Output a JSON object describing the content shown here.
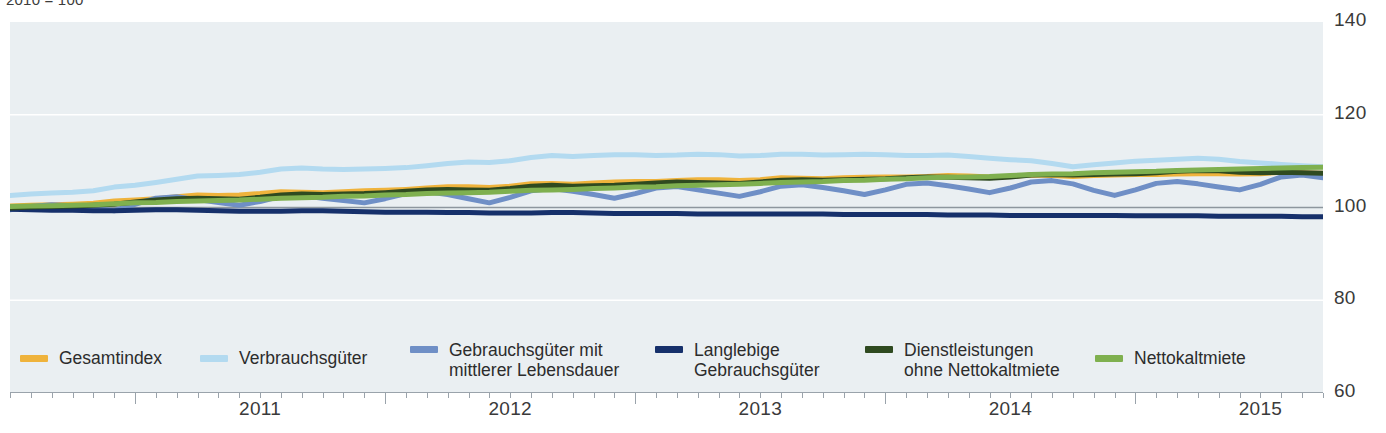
{
  "caption": "2010 = 100",
  "axes": {
    "y_ticks": [
      "140",
      "120",
      "100",
      "80",
      "60"
    ],
    "x_ticks": [
      "2011",
      "2012",
      "2013",
      "2014",
      "2015"
    ]
  },
  "legend": [
    {
      "label": "Gesamtindex",
      "color": "#efb33c"
    },
    {
      "label": "Verbrauchsgüter",
      "color": "#b3daf0"
    },
    {
      "label": "Gebrauchsgüter mit\nmittlerer Lebensdauer",
      "color": "#6f8fc6"
    },
    {
      "label": "Langlebige\nGebrauchsgüter",
      "color": "#16306b"
    },
    {
      "label": "Dienstleistungen\nohne Nettokaltmiete",
      "color": "#2f4a20"
    },
    {
      "label": "Nettokaltmiete",
      "color": "#7fb04f"
    }
  ],
  "chart_data": {
    "type": "line",
    "title": "",
    "subtitle": "2010 = 100",
    "xlabel": "",
    "ylabel": "",
    "ylim": [
      60,
      140
    ],
    "y_ticks": [
      60,
      80,
      100,
      120,
      140
    ],
    "grid": true,
    "legend_position": "bottom",
    "x_tick_labels": [
      "2011",
      "2012",
      "2013",
      "2014",
      "2015"
    ],
    "x_start": "2010-07",
    "x_end": "2015-10",
    "x_frequency": "monthly",
    "series": [
      {
        "name": "Gesamtindex",
        "color": "#efb33c",
        "values": [
          100.3,
          100.5,
          100.6,
          100.7,
          100.9,
          101.4,
          101.6,
          101.9,
          102.3,
          102.7,
          102.6,
          102.7,
          103.0,
          103.4,
          103.3,
          103.2,
          103.4,
          103.6,
          103.7,
          103.9,
          104.2,
          104.5,
          104.5,
          104.3,
          104.6,
          105.1,
          105.2,
          105.0,
          105.3,
          105.5,
          105.6,
          105.6,
          105.8,
          106.0,
          106.0,
          105.8,
          106.0,
          106.4,
          106.3,
          106.2,
          106.4,
          106.5,
          106.6,
          106.6,
          106.7,
          106.9,
          106.8,
          106.6,
          106.7,
          107.0,
          106.9,
          106.7,
          106.9,
          107.0,
          107.1,
          107.1,
          107.2,
          107.3,
          107.3,
          107.2,
          107.3,
          107.6,
          107.5,
          107.4
        ]
      },
      {
        "name": "Verbrauchsgüter",
        "color": "#b3daf0",
        "values": [
          102.6,
          102.9,
          103.1,
          103.3,
          103.6,
          104.4,
          104.8,
          105.4,
          106.1,
          106.8,
          106.9,
          107.1,
          107.6,
          108.3,
          108.5,
          108.3,
          108.2,
          108.3,
          108.4,
          108.6,
          109.0,
          109.5,
          109.8,
          109.7,
          110.1,
          110.8,
          111.2,
          111.0,
          111.2,
          111.4,
          111.4,
          111.2,
          111.3,
          111.5,
          111.4,
          111.1,
          111.2,
          111.5,
          111.5,
          111.3,
          111.4,
          111.5,
          111.4,
          111.2,
          111.2,
          111.3,
          111.0,
          110.6,
          110.3,
          110.1,
          109.5,
          108.8,
          109.2,
          109.6,
          110.0,
          110.2,
          110.4,
          110.6,
          110.4,
          109.9,
          109.6,
          109.3,
          109.0,
          108.8
        ]
      },
      {
        "name": "Gebrauchsgüter mit mittlerer Lebensdauer",
        "color": "#6f8fc6",
        "values": [
          99.5,
          100.2,
          100.6,
          100.4,
          99.9,
          99.3,
          100.7,
          102.0,
          102.3,
          101.7,
          101.1,
          100.5,
          101.3,
          102.4,
          102.6,
          102.0,
          101.5,
          101.0,
          101.9,
          103.0,
          103.4,
          102.8,
          101.9,
          101.0,
          102.2,
          103.6,
          104.1,
          103.5,
          102.8,
          102.0,
          103.0,
          104.2,
          104.5,
          103.8,
          103.1,
          102.4,
          103.4,
          104.6,
          104.9,
          104.3,
          103.6,
          102.8,
          103.8,
          105.0,
          105.3,
          104.7,
          104.0,
          103.2,
          104.2,
          105.5,
          105.8,
          105.1,
          103.7,
          102.6,
          103.8,
          105.2,
          105.6,
          105.1,
          104.4,
          103.8,
          105.0,
          106.6,
          107.0,
          106.4
        ]
      },
      {
        "name": "Langlebige Gebrauchsgüter",
        "color": "#16306b",
        "values": [
          99.6,
          99.5,
          99.4,
          99.4,
          99.3,
          99.3,
          99.4,
          99.5,
          99.5,
          99.4,
          99.3,
          99.2,
          99.2,
          99.2,
          99.3,
          99.3,
          99.2,
          99.1,
          99.0,
          99.0,
          99.0,
          98.9,
          98.9,
          98.8,
          98.8,
          98.8,
          98.9,
          98.9,
          98.8,
          98.7,
          98.7,
          98.7,
          98.7,
          98.6,
          98.6,
          98.6,
          98.6,
          98.6,
          98.6,
          98.6,
          98.5,
          98.5,
          98.5,
          98.5,
          98.5,
          98.4,
          98.4,
          98.4,
          98.3,
          98.3,
          98.3,
          98.3,
          98.3,
          98.3,
          98.2,
          98.2,
          98.2,
          98.2,
          98.1,
          98.1,
          98.1,
          98.1,
          98.0,
          98.0
        ]
      },
      {
        "name": "Dienstleistungen ohne Nettokaltmiete",
        "color": "#2f4a20",
        "values": [
          99.9,
          100.1,
          100.2,
          100.3,
          100.5,
          100.7,
          101.2,
          101.6,
          101.9,
          102.0,
          101.9,
          101.8,
          102.2,
          102.7,
          102.9,
          102.8,
          102.9,
          103.0,
          103.2,
          103.5,
          103.8,
          103.9,
          103.8,
          103.7,
          104.1,
          104.6,
          104.8,
          104.6,
          104.7,
          104.8,
          105.0,
          105.3,
          105.5,
          105.4,
          105.3,
          105.2,
          105.5,
          105.9,
          106.0,
          105.9,
          106.0,
          106.1,
          106.2,
          106.4,
          106.6,
          106.5,
          106.4,
          106.3,
          106.6,
          107.0,
          107.1,
          107.0,
          107.1,
          107.2,
          107.3,
          107.5,
          107.8,
          108.0,
          107.9,
          107.6,
          107.5,
          107.6,
          107.5,
          107.4
        ]
      },
      {
        "name": "Nettokaltmiete",
        "color": "#7fb04f",
        "values": [
          100.2,
          100.3,
          100.4,
          100.5,
          100.6,
          100.8,
          101.0,
          101.1,
          101.3,
          101.4,
          101.5,
          101.6,
          101.8,
          102.0,
          102.1,
          102.2,
          102.4,
          102.5,
          102.7,
          102.8,
          103.0,
          103.1,
          103.2,
          103.3,
          103.5,
          103.7,
          103.8,
          103.9,
          104.1,
          104.2,
          104.4,
          104.5,
          104.7,
          104.8,
          104.9,
          105.0,
          105.2,
          105.4,
          105.5,
          105.6,
          105.8,
          105.9,
          106.1,
          106.2,
          106.4,
          106.5,
          106.6,
          106.7,
          106.9,
          107.1,
          107.2,
          107.3,
          107.5,
          107.6,
          107.7,
          107.8,
          108.0,
          108.1,
          108.2,
          108.3,
          108.4,
          108.5,
          108.6,
          108.7
        ]
      }
    ]
  }
}
